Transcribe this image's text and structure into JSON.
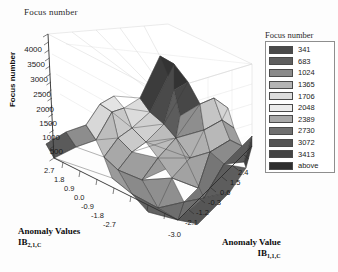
{
  "chart_title": "Focus number",
  "legend": {
    "title": "Focus number",
    "entries": [
      {
        "label": "341",
        "color": "#4a4a4a"
      },
      {
        "label": "683",
        "color": "#5e5e5e"
      },
      {
        "label": "1024",
        "color": "#8a8a8a"
      },
      {
        "label": "1365",
        "color": "#b4b4b4"
      },
      {
        "label": "1706",
        "color": "#dcdcdc"
      },
      {
        "label": "2048",
        "color": "#ececec"
      },
      {
        "label": "2389",
        "color": "#a9a9a9"
      },
      {
        "label": "2730",
        "color": "#6f6f6f"
      },
      {
        "label": "3072",
        "color": "#545454"
      },
      {
        "label": "3413",
        "color": "#434343"
      },
      {
        "label": "above",
        "color": "#2e2e2e"
      }
    ]
  },
  "zaxis": {
    "title": "Focus number",
    "ticks": [
      "4000",
      "3500",
      "3000",
      "2500",
      "2000",
      "1500",
      "1000",
      "500"
    ]
  },
  "xaxis_left": {
    "caption_line1": "Anomaly Values",
    "caption_symbol": "IB",
    "caption_subscript": "2,1,C",
    "ticks": [
      "2.7",
      "1.8",
      "0.9",
      "0.0",
      "-0.9",
      "-1.8",
      "-2.7"
    ]
  },
  "xaxis_right": {
    "caption_line1": "Anomaly Value",
    "caption_symbol": "IB",
    "caption_subscript": "1,1,C",
    "ticks": [
      "2.4",
      "1.5",
      "0.6",
      "-0.3",
      "-1.2",
      "-2.1",
      "-3.0"
    ]
  },
  "chart_data": {
    "type": "surface",
    "title": "Focus number",
    "zlabel": "Focus number",
    "xlabel": "Anomaly Value IB(1,1,C)",
    "ylabel": "Anomaly Values IB(2,1,C)",
    "zlim": [
      0,
      4000
    ],
    "ztick_step": 500,
    "xlim": [
      -3.0,
      2.4
    ],
    "xtick_step": 0.9,
    "ylim": [
      -2.7,
      2.7
    ],
    "ytick_step": 0.9,
    "grid": true,
    "legend_position": "right",
    "colorscale": "grayscale-banded",
    "contour_levels": [
      341,
      683,
      1024,
      1365,
      1706,
      2048,
      2389,
      2730,
      3072,
      3413
    ],
    "x": [
      -3.0,
      -2.1,
      -1.2,
      -0.3,
      0.6,
      1.5,
      2.4
    ],
    "y": [
      -2.7,
      -1.8,
      -0.9,
      0.0,
      0.9,
      1.8,
      2.7
    ],
    "z": [
      [
        120,
        180,
        300,
        420,
        300,
        180,
        120
      ],
      [
        180,
        420,
        900,
        1250,
        900,
        420,
        180
      ],
      [
        300,
        980,
        1850,
        2400,
        1850,
        980,
        300
      ],
      [
        430,
        1400,
        2500,
        3950,
        2500,
        1400,
        430
      ],
      [
        300,
        980,
        1850,
        2400,
        1850,
        980,
        300
      ],
      [
        180,
        420,
        900,
        1250,
        900,
        420,
        180
      ],
      [
        120,
        180,
        300,
        420,
        300,
        180,
        120
      ]
    ]
  }
}
